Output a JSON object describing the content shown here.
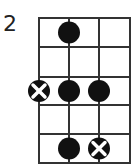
{
  "fret_label": "2",
  "grid": {
    "strings": 4,
    "frets": 5,
    "x": [
      39,
      69,
      99,
      130
    ],
    "y": [
      18,
      47,
      77,
      105,
      134,
      163
    ],
    "line_color": "#333333"
  },
  "markers": [
    {
      "type": "dot",
      "string": 2,
      "fret": 1
    },
    {
      "type": "x-dot",
      "string": 1,
      "fret": 3
    },
    {
      "type": "dot",
      "string": 2,
      "fret": 3
    },
    {
      "type": "dot",
      "string": 3,
      "fret": 3
    },
    {
      "type": "dot",
      "string": 2,
      "fret": 5
    },
    {
      "type": "x-dot",
      "string": 3,
      "fret": 5
    }
  ],
  "colors": {
    "dot": "#111111",
    "x": "#ffffff"
  }
}
